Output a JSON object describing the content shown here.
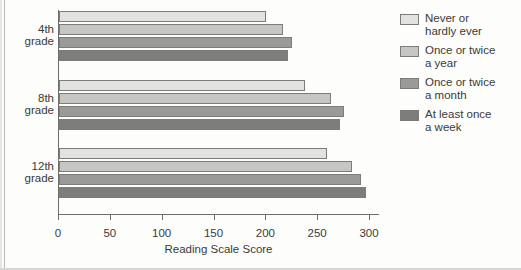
{
  "chart_data": {
    "type": "bar",
    "orientation": "horizontal",
    "title": "",
    "xlabel": "Reading Scale Score",
    "ylabel": "",
    "xlim": [
      0,
      300
    ],
    "xticks": [
      0,
      50,
      100,
      150,
      200,
      250,
      300
    ],
    "xticklabels": [
      "0",
      "50",
      "100",
      "150",
      "200",
      "250",
      "300"
    ],
    "categories": [
      "4th grade",
      "8th grade",
      "12th grade"
    ],
    "grid": false,
    "legend_position": "right",
    "series": [
      {
        "name": "Never or hardly ever",
        "color": "#e2e2e0",
        "values": [
          200,
          237,
          259
        ]
      },
      {
        "name": "Once or twice a year",
        "color": "#c6c6c3",
        "values": [
          216,
          262,
          283
        ]
      },
      {
        "name": "Once or twice a month",
        "color": "#9a9a98",
        "values": [
          225,
          275,
          291
        ]
      },
      {
        "name": "At least once a week",
        "color": "#7d7d7b",
        "values": [
          221,
          271,
          296
        ]
      }
    ]
  },
  "legend": {
    "items": [
      {
        "label": "Never or\nhardly ever",
        "color": "#e2e2e0"
      },
      {
        "label": "Once or twice\na year",
        "color": "#c6c6c3"
      },
      {
        "label": "Once or twice\na month",
        "color": "#9a9a98"
      },
      {
        "label": "At least once\na week",
        "color": "#7d7d7b"
      }
    ]
  },
  "axes": {
    "y_category_labels": [
      "4th\ngrade",
      "8th\ngrade",
      "12th\ngrade"
    ]
  }
}
